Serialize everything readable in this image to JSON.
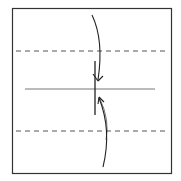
{
  "diagram": {
    "type": "origami-fold-step",
    "paper": {
      "x": 12,
      "y": 8,
      "width": 159,
      "height": 165,
      "stroke": "#333333"
    },
    "valley_folds": [
      {
        "y": 51,
        "style": "dashed"
      },
      {
        "y": 131,
        "style": "dashed"
      }
    ],
    "crease": {
      "y": 89,
      "x1": 25,
      "x2": 155
    },
    "center_mark": {
      "x": 95,
      "y1": 61,
      "y2": 115
    },
    "arrows": [
      {
        "name": "fold-top-down",
        "direction": "down"
      },
      {
        "name": "fold-bottom-up",
        "direction": "up"
      }
    ],
    "colors": {
      "line": "#333333",
      "crease": "#555555",
      "background": "#ffffff"
    }
  }
}
